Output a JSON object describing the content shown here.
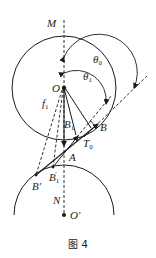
{
  "figure": {
    "caption": "图 4",
    "labels": {
      "M": "M",
      "O": "O",
      "f1": "f",
      "f1_sub": "1",
      "theta0": "θ",
      "theta0_sub": "0",
      "theta1": "θ",
      "theta1_sub": "1",
      "B": "B",
      "B1": "B",
      "B1_sub": "1",
      "T0": "T",
      "T0_sub": "0",
      "A": "A",
      "Bprime": "B′",
      "B1prime": "B",
      "B1prime_sub": "1",
      "B1prime_mark": "′",
      "N": "N",
      "Oprime": "O′"
    },
    "colors": {
      "stroke": "#1a1a1a",
      "background": "#ffffff"
    }
  }
}
